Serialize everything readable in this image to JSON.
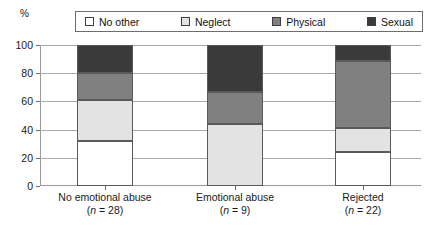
{
  "axis": {
    "y_unit": "%",
    "y_ticks": [
      0,
      20,
      40,
      60,
      80,
      100
    ]
  },
  "legend": {
    "items": [
      {
        "label": "No other",
        "color": "#ffffff",
        "name": "legend-swatch-no-other"
      },
      {
        "label": "Neglect",
        "color": "#e3e3e3",
        "name": "legend-swatch-neglect"
      },
      {
        "label": "Physical",
        "color": "#808080",
        "name": "legend-swatch-physical"
      },
      {
        "label": "Sexual",
        "color": "#3a3a3a",
        "name": "legend-swatch-sexual"
      }
    ]
  },
  "categories": [
    {
      "name": "No emotional abuse",
      "n_text": "(n = 28)",
      "n_prefix": "(",
      "n_symbol": "n",
      "n_value": " = 28)"
    },
    {
      "name": "Emotional abuse",
      "n_text": "(n = 9)",
      "n_prefix": "(",
      "n_symbol": "n",
      "n_value": " = 9)"
    },
    {
      "name": "Rejected",
      "n_text": "(n = 22)",
      "n_prefix": "(",
      "n_symbol": "n",
      "n_value": " = 22)"
    }
  ],
  "chart_data": {
    "type": "bar",
    "title": "",
    "subtitle": "",
    "xlabel": "",
    "ylabel": "%",
    "ylim": [
      0,
      100
    ],
    "yticks": [
      0,
      20,
      40,
      60,
      80,
      100
    ],
    "grid": true,
    "stacked": true,
    "legend_position": "top",
    "categories": [
      "No emotional abuse (n = 28)",
      "Emotional abuse (n = 9)",
      "Rejected (n = 22)"
    ],
    "series": [
      {
        "name": "No other",
        "color": "#ffffff",
        "values": [
          32,
          0,
          24
        ]
      },
      {
        "name": "Neglect",
        "color": "#e3e3e3",
        "values": [
          29,
          44,
          17
        ]
      },
      {
        "name": "Physical",
        "color": "#808080",
        "values": [
          19,
          23,
          48
        ]
      },
      {
        "name": "Sexual",
        "color": "#3a3a3a",
        "values": [
          20,
          33,
          11
        ]
      }
    ],
    "annotations": []
  }
}
